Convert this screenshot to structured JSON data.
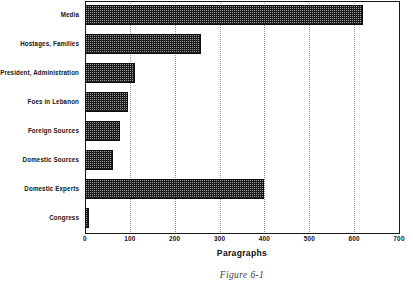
{
  "figure": {
    "caption": "Figure 6-1"
  },
  "chart_data": {
    "type": "bar",
    "orientation": "horizontal",
    "title": "",
    "subtitle": "",
    "xlabel": "Paragraphs",
    "ylabel": "",
    "xlim": [
      0,
      700
    ],
    "xticks": [
      0,
      100,
      200,
      300,
      400,
      500,
      600,
      700
    ],
    "xtick_labels": [
      "0",
      "100",
      "200",
      "300",
      "400",
      "500",
      "600",
      "700"
    ],
    "grid": "vertical-dotted",
    "legend": null,
    "categories": [
      "Media",
      "Hostages, Families",
      "President, Administration",
      "Foes in Lebanon",
      "Foreign Sources",
      "Domestic Sources",
      "Domestic Experts",
      "Congress"
    ],
    "values": [
      620,
      258,
      111,
      96,
      78,
      62,
      400,
      10
    ],
    "bar_color": "#1c1c1c",
    "bar_fill": "dithered-dark-crosshatch",
    "background": "#ffffff"
  }
}
